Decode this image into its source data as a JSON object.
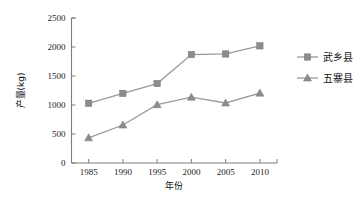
{
  "chart_data": {
    "type": "line",
    "title": "",
    "xlabel": "年份",
    "ylabel": "产量(kg)",
    "categories": [
      "1985",
      "1990",
      "1995",
      "2000",
      "2005",
      "2010"
    ],
    "x": [
      1985,
      1990,
      1995,
      2000,
      2005,
      2010
    ],
    "xlim": [
      1982.5,
      2012.5
    ],
    "ylim": [
      0,
      2500
    ],
    "yticks": [
      "0",
      "500",
      "1000",
      "1500",
      "2000",
      "2500"
    ],
    "ytick_values": [
      0,
      500,
      1000,
      1500,
      2000,
      2500
    ],
    "xticks": [
      "1985",
      "1990",
      "1995",
      "2000",
      "2005",
      "2010"
    ],
    "grid": false,
    "legend_position": "right",
    "series": [
      {
        "name": "武乡县",
        "marker": "square",
        "color": "#8c8c8c",
        "values": [
          1030,
          1200,
          1370,
          1870,
          1880,
          2020
        ]
      },
      {
        "name": "五寨县",
        "marker": "triangle",
        "color": "#8c8c8c",
        "values": [
          435,
          655,
          1005,
          1135,
          1035,
          1205
        ]
      }
    ]
  },
  "axis": {
    "y_title": "产量(kg)",
    "x_title": "年份"
  },
  "legend": {
    "items": [
      {
        "label": "武乡县",
        "marker": "square-marker"
      },
      {
        "label": "五寨县",
        "marker": "triangle-marker"
      }
    ]
  }
}
